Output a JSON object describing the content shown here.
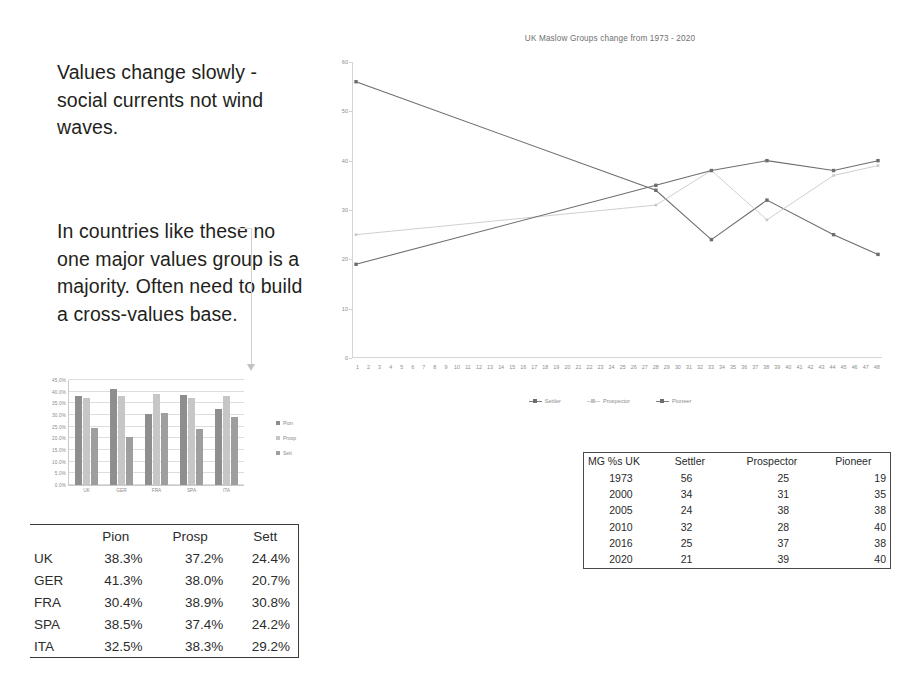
{
  "callouts": [
    "Values change slowly - social currents not wind waves.",
    "In countries like these no one major values group is a majority. Often need to build a cross-values base."
  ],
  "bar_legend": [
    "Pion",
    "Prosp",
    "Sett"
  ],
  "pct_table": {
    "headers": [
      "",
      "Pion",
      "Prosp",
      "Sett"
    ],
    "rows": [
      {
        "country": "UK",
        "pion": "38.3%",
        "prosp": "37.2%",
        "sett": "24.4%"
      },
      {
        "country": "GER",
        "pion": "41.3%",
        "prosp": "38.0%",
        "sett": "20.7%"
      },
      {
        "country": "FRA",
        "pion": "30.4%",
        "prosp": "38.9%",
        "sett": "30.8%"
      },
      {
        "country": "SPA",
        "pion": "38.5%",
        "prosp": "37.4%",
        "sett": "24.2%"
      },
      {
        "country": "ITA",
        "pion": "32.5%",
        "prosp": "38.3%",
        "sett": "29.2%"
      }
    ]
  },
  "mg_table": {
    "headers": [
      "MG %s UK",
      "Settler",
      "Prospector",
      "Pioneer"
    ],
    "rows": [
      {
        "year": "1973",
        "settler": "56",
        "prospector": "25",
        "pioneer": "19"
      },
      {
        "year": "2000",
        "settler": "34",
        "prospector": "31",
        "pioneer": "35"
      },
      {
        "year": "2005",
        "settler": "24",
        "prospector": "38",
        "pioneer": "38"
      },
      {
        "year": "2010",
        "settler": "32",
        "prospector": "28",
        "pioneer": "40"
      },
      {
        "year": "2016",
        "settler": "25",
        "prospector": "37",
        "pioneer": "38"
      },
      {
        "year": "2020",
        "settler": "21",
        "prospector": "39",
        "pioneer": "40"
      }
    ]
  },
  "colors": {
    "pion": "#8e8e8e",
    "prosp": "#c6c6c6",
    "sett": "#9e9e9e",
    "line_dark": "#6d6d6d",
    "line_light": "#c9c9c9",
    "text": "#231f20"
  },
  "chart_data": [
    {
      "type": "line",
      "title": "UK Maslow Groups change from 1973 - 2020",
      "xlabel": "",
      "ylabel": "",
      "x": [
        1,
        2,
        3,
        4,
        5,
        6,
        7,
        8,
        9,
        10,
        11,
        12,
        13,
        14,
        15,
        16,
        17,
        18,
        19,
        20,
        21,
        22,
        23,
        24,
        25,
        26,
        27,
        28,
        29,
        30,
        31,
        32,
        33,
        34,
        35,
        36,
        37,
        38,
        39,
        40,
        41,
        42,
        43,
        44,
        45,
        46,
        47,
        48
      ],
      "xlim": [
        1,
        48
      ],
      "ylim": [
        0,
        60
      ],
      "yticks": [
        0,
        10,
        20,
        30,
        40,
        50,
        60
      ],
      "grid": false,
      "legend_position": "bottom",
      "point_x": [
        1,
        28,
        33,
        38,
        44,
        48
      ],
      "point_years": [
        "1973",
        "2000",
        "2005",
        "2010",
        "2016",
        "2020"
      ],
      "series": [
        {
          "name": "Settler",
          "values": [
            56,
            34,
            24,
            32,
            25,
            21
          ],
          "color": "#6d6d6d",
          "style": "solid"
        },
        {
          "name": "Prospector",
          "values": [
            25,
            31,
            38,
            28,
            37,
            39
          ],
          "color": "#c9c9c9",
          "style": "light"
        },
        {
          "name": "Pioneer",
          "values": [
            19,
            35,
            38,
            40,
            38,
            40
          ],
          "color": "#6d6d6d",
          "style": "solid"
        }
      ]
    },
    {
      "type": "bar",
      "title": "",
      "categories": [
        "UK",
        "GER",
        "FRA",
        "SPA",
        "ITA"
      ],
      "ylim": [
        0,
        45
      ],
      "yticks": [
        "0.0%",
        "5.0%",
        "10.0%",
        "15.0%",
        "20.0%",
        "25.0%",
        "30.0%",
        "35.0%",
        "40.0%",
        "45.0%"
      ],
      "ytick_values": [
        0,
        5,
        10,
        15,
        20,
        25,
        30,
        35,
        40,
        45
      ],
      "grid": true,
      "legend_position": "right",
      "series": [
        {
          "name": "Pion",
          "values": [
            38.3,
            41.3,
            30.4,
            38.5,
            32.5
          ],
          "color": "#8e8e8e"
        },
        {
          "name": "Prosp",
          "values": [
            37.2,
            38.0,
            38.9,
            37.4,
            38.3
          ],
          "color": "#c6c6c6"
        },
        {
          "name": "Sett",
          "values": [
            24.4,
            20.7,
            30.8,
            24.2,
            29.2
          ],
          "color": "#9e9e9e"
        }
      ]
    }
  ]
}
